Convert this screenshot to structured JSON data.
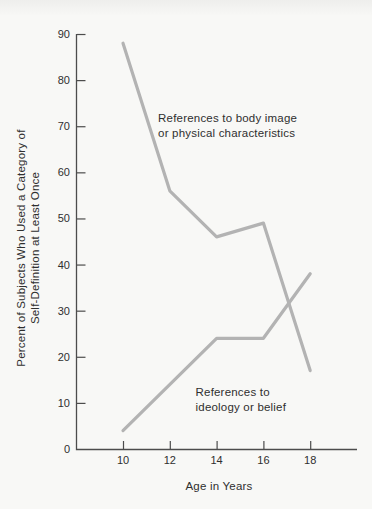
{
  "figure": {
    "background": "#f8f8f6",
    "line_color": "#b3b3b3",
    "axis_color": "#4c4c4c",
    "text_color": "#2f2f2f"
  },
  "chart_data": {
    "type": "line",
    "title": "",
    "xlabel": "Age in Years",
    "ylabel": "Percent of Subjects Who Used a Category of Self-Definition at Least Once",
    "ylabel_lines": [
      "Percent of Subjects Who Used a Category of",
      "Self-Definition at Least Once"
    ],
    "xlim": [
      8,
      20
    ],
    "ylim": [
      0,
      90
    ],
    "x_ticks": [
      10,
      12,
      14,
      16,
      18
    ],
    "y_ticks": [
      0,
      10,
      20,
      30,
      40,
      50,
      60,
      70,
      80,
      90
    ],
    "grid": false,
    "legend_position": "inline-annotations",
    "series": [
      {
        "name": "References to body image or physical characteristics",
        "x": [
          10,
          12,
          14,
          16,
          18
        ],
        "values": [
          88,
          56,
          46,
          49,
          17
        ]
      },
      {
        "name": "References to ideology or belief",
        "x": [
          10,
          14,
          16,
          18
        ],
        "values": [
          4,
          24,
          24,
          38
        ]
      }
    ],
    "annotations": [
      {
        "lines": [
          "References to body image",
          "or physical characteristics"
        ],
        "x": 11.5,
        "y": 71
      },
      {
        "lines": [
          "References to",
          "ideology or belief"
        ],
        "x": 13.1,
        "y": 11.5
      }
    ]
  }
}
